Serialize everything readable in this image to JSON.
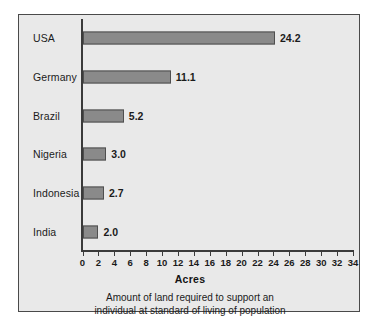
{
  "chart_data": {
    "type": "bar",
    "orientation": "horizontal",
    "title": "",
    "xlabel": "Acres",
    "ylabel": "",
    "categories": [
      "USA",
      "Germany",
      "Brazil",
      "Nigeria",
      "Indonesia",
      "India"
    ],
    "values": [
      24.2,
      11.1,
      5.2,
      3.0,
      2.7,
      2.0
    ],
    "value_labels": [
      "24.2",
      "11.1",
      "5.2",
      "3.0",
      "2.7",
      "2.0"
    ],
    "xlim": [
      0,
      34
    ],
    "xticks": [
      0,
      2,
      4,
      6,
      8,
      10,
      12,
      14,
      16,
      18,
      20,
      22,
      24,
      26,
      28,
      30,
      32,
      34
    ],
    "xtick_labels": [
      "0",
      "2",
      "4",
      "6",
      "8",
      "10",
      "12",
      "14",
      "16",
      "18",
      "20",
      "22",
      "24",
      "26",
      "28",
      "30",
      "32",
      "34"
    ],
    "grid": false,
    "legend": null,
    "bar_color": "#8a8a8a",
    "bar_edge_color": "#4f4f4f",
    "background_color": "#e9e9e9",
    "frame_color": "#4a4a4a"
  },
  "caption": {
    "line1": "Amount of land required to support an",
    "line2": "individual at standard of living of population"
  }
}
